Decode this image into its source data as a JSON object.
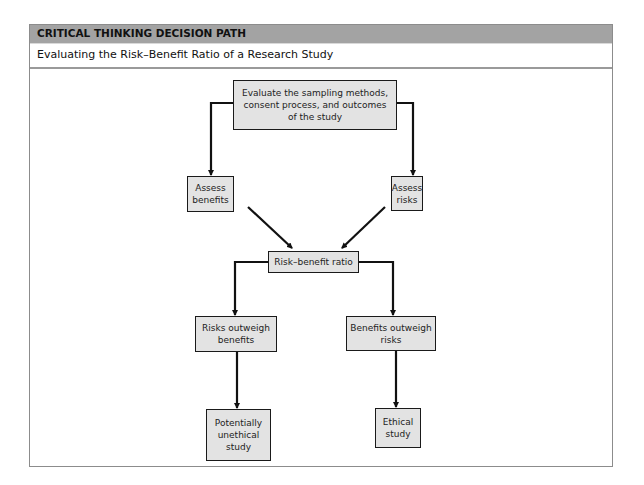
{
  "header": {
    "label": "CRITICAL THINKING DECISION PATH",
    "subtitle": "Evaluating the Risk–Benefit Ratio of a Research Study"
  },
  "colors": {
    "header_bar": "#a3a3a3",
    "box_fill": "#e3e3e3",
    "box_border": "#1a1a1a",
    "arrow": "#111111",
    "frame_border": "#8c8c8c"
  },
  "diagram": {
    "nodes": {
      "evaluate": "Evaluate the sampling methods,\nconsent process, and outcomes\nof the study",
      "assess_benefits": "Assess\nbenefits",
      "assess_risks": "Assess\nrisks",
      "ratio": "Risk–benefit ratio",
      "risks_outweigh": "Risks outweigh\nbenefits",
      "benefits_outweigh": "Benefits outweigh\nrisks",
      "unethical": "Potentially\nunethical\nstudy",
      "ethical": "Ethical\nstudy"
    },
    "edges": [
      {
        "from": "evaluate",
        "to": "assess_benefits"
      },
      {
        "from": "evaluate",
        "to": "assess_risks"
      },
      {
        "from": "assess_benefits",
        "to": "ratio"
      },
      {
        "from": "assess_risks",
        "to": "ratio"
      },
      {
        "from": "ratio",
        "to": "risks_outweigh"
      },
      {
        "from": "ratio",
        "to": "benefits_outweigh"
      },
      {
        "from": "risks_outweigh",
        "to": "unethical"
      },
      {
        "from": "benefits_outweigh",
        "to": "ethical"
      }
    ]
  }
}
